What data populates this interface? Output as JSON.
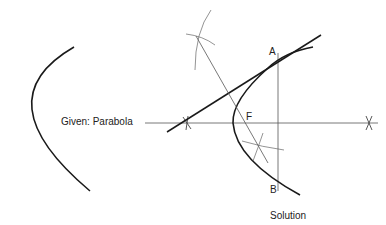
{
  "labels": {
    "given": "Given: Parabola",
    "solution": "Solution",
    "point_a": "A",
    "point_f": "F",
    "point_b": "B"
  },
  "colors": {
    "stroke": "#1a1a1a",
    "construction": "#555555",
    "background": "#ffffff"
  }
}
